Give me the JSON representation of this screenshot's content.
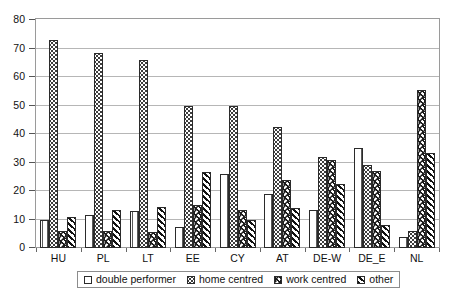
{
  "chart_data": {
    "type": "bar",
    "title": "",
    "xlabel": "",
    "ylabel": "",
    "ylim": [
      0,
      80
    ],
    "ytick_step": 10,
    "yticks": [
      "0",
      "10",
      "20",
      "30",
      "40",
      "50",
      "60",
      "70",
      "80"
    ],
    "grid": "horizontal",
    "legend_position": "bottom",
    "categories": [
      "HU",
      "PL",
      "LT",
      "EE",
      "CY",
      "AT",
      "DE-W",
      "DE_E",
      "NL"
    ],
    "series": [
      {
        "name": "double performer",
        "pattern": "vertical-lines",
        "values": [
          10,
          11.5,
          13,
          7.5,
          26,
          19,
          13.5,
          35,
          4
        ]
      },
      {
        "name": "home centred",
        "pattern": "dotted",
        "values": [
          73,
          68.5,
          66,
          50,
          50,
          42.5,
          32,
          29,
          6
        ]
      },
      {
        "name": "work centred",
        "pattern": "chevron-light",
        "values": [
          6,
          6,
          5.5,
          15,
          13.5,
          24,
          31,
          27,
          55.5
        ]
      },
      {
        "name": "other",
        "pattern": "chevron-dark",
        "values": [
          11,
          13.5,
          14.5,
          26.5,
          10,
          14,
          22.5,
          8,
          33.5
        ]
      }
    ]
  },
  "legend": {
    "items": [
      {
        "label": "double performer"
      },
      {
        "label": "home centred"
      },
      {
        "label": "work centred"
      },
      {
        "label": "other"
      }
    ]
  },
  "colors": {
    "axis": "#9a9a9a",
    "gridline": "#b6b6b6",
    "bar_outline": "#2b2b2b",
    "text": "#111111",
    "background": "#ffffff"
  }
}
